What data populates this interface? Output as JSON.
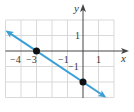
{
  "chart_data": {
    "type": "line",
    "title": "",
    "xlabel": "x",
    "ylabel": "y",
    "xlim": [
      -5,
      2
    ],
    "ylim": [
      -3,
      2
    ],
    "grid": true,
    "x_ticks": [
      {
        "value": -4,
        "label": "−4"
      },
      {
        "value": -3,
        "label": "−3"
      },
      {
        "value": -1,
        "label": "−1"
      },
      {
        "value": 1,
        "label": "1"
      }
    ],
    "y_ticks": [
      {
        "value": 1,
        "label": "1"
      },
      {
        "value": -1,
        "label": "−1"
      }
    ],
    "series": [
      {
        "name": "line",
        "equation": "y = -2/3 x - 2",
        "slope": -0.6667,
        "intercept": -2,
        "x": [
          -5,
          1.5
        ],
        "y": [
          1.33,
          -3
        ],
        "arrows": "both",
        "color": "#3a9fd6"
      }
    ],
    "points": [
      {
        "x": -3,
        "y": 0,
        "label": "x-intercept"
      },
      {
        "x": 0,
        "y": -2,
        "label": "y-intercept"
      }
    ]
  },
  "colors": {
    "line": "#3a9fd6",
    "grid": "#d9d9d9",
    "axis": "#444444",
    "point": "#111111"
  }
}
